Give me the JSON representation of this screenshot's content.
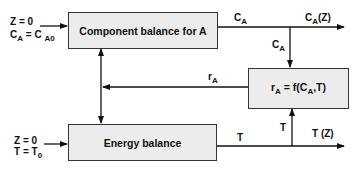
{
  "blocks": {
    "component_balance": "Component balance for A",
    "reaction_rate_main": "r",
    "reaction_rate_sub": "A",
    "reaction_rate_expr": " = f(C",
    "reaction_rate_expr_sub": "A",
    "reaction_rate_expr_end": ",T)",
    "energy_balance": "Energy balance"
  },
  "inputs": {
    "component": {
      "line1": "Z = 0",
      "line2_main": "C",
      "line2_sub": "A",
      "line2_eq": " = C ",
      "line2_sub2": "A0"
    },
    "energy": {
      "line1": "Z = 0",
      "line2_main": "T = T",
      "line2_sub": "0"
    }
  },
  "signals": {
    "ca_main": "C",
    "ca_sub": "A",
    "ca_out_main": "C",
    "ca_out_sub": "A",
    "ca_out_end": "(Z)",
    "ca_down_main": "C",
    "ca_down_sub": "A",
    "ra_main": "r",
    "ra_sub": "A",
    "t": "T",
    "t_up": "T",
    "t_out": "T (Z)"
  },
  "colors": {
    "line": "#111111",
    "box_fill": "#ececec",
    "box_border": "#333333"
  }
}
